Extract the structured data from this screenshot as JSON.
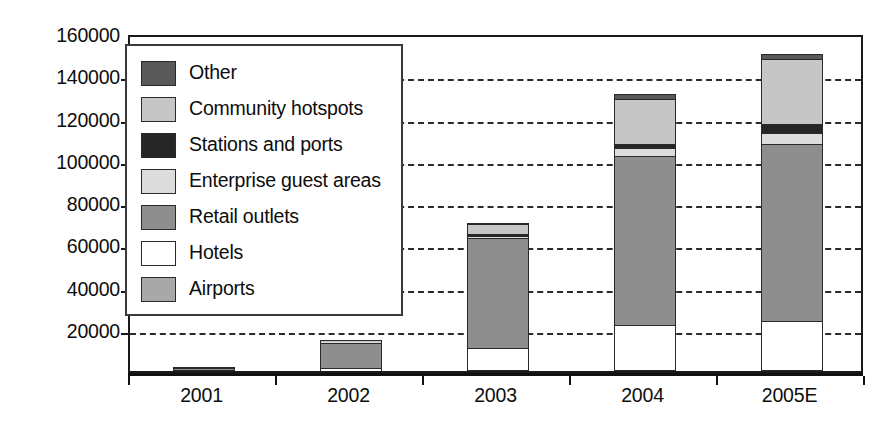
{
  "chart_data": {
    "type": "bar",
    "subtype": "stacked-vertical",
    "title": "",
    "xlabel": "",
    "ylabel": "",
    "categories": [
      "2001",
      "2002",
      "2003",
      "2004",
      "2005E"
    ],
    "ylim": [
      0,
      160000
    ],
    "ytick_step": 20000,
    "yticks": [
      0,
      20000,
      40000,
      60000,
      80000,
      100000,
      120000,
      140000,
      160000
    ],
    "ytick_labels": [
      "0",
      "20000",
      "40000",
      "60000",
      "80000",
      "100000",
      "120000",
      "140000",
      "160000"
    ],
    "grid": true,
    "grid_style": "dashed",
    "legend_position": "upper-left-inside",
    "stack_order_bottom_to_top": [
      "Airports",
      "Hotels",
      "Retail outlets",
      "Enterprise guest areas",
      "Stations and ports",
      "Community hotspots",
      "Other"
    ],
    "series": [
      {
        "name": "Airports",
        "color": "#a8a8a8",
        "values": [
          300,
          200,
          400,
          500,
          600
        ]
      },
      {
        "name": "Hotels",
        "color": "#ffffff",
        "values": [
          400,
          1200,
          10600,
          21500,
          23000
        ]
      },
      {
        "name": "Retail outlets",
        "color": "#8e8e8e",
        "values": [
          500,
          12000,
          52000,
          80000,
          84000
        ]
      },
      {
        "name": "Enterprise guest areas",
        "color": "#dcdcdc",
        "values": [
          100,
          300,
          800,
          3500,
          5000
        ]
      },
      {
        "name": "Stations and ports",
        "color": "#262626",
        "values": [
          100,
          200,
          1200,
          2000,
          4500
        ]
      },
      {
        "name": "Community hotspots",
        "color": "#c6c6c6",
        "values": [
          100,
          100,
          4500,
          21500,
          30500
        ]
      },
      {
        "name": "Other",
        "color": "#595959",
        "values": [
          0,
          0,
          500,
          2000,
          2400
        ]
      }
    ],
    "totals": [
      1500,
      14000,
      70000,
      131000,
      150000
    ]
  },
  "legend": {
    "items": [
      {
        "label": "Other",
        "color": "#595959"
      },
      {
        "label": "Community hotspots",
        "color": "#c6c6c6"
      },
      {
        "label": "Stations and ports",
        "color": "#262626"
      },
      {
        "label": "Enterprise guest areas",
        "color": "#dcdcdc"
      },
      {
        "label": "Retail outlets",
        "color": "#8e8e8e"
      },
      {
        "label": "Hotels",
        "color": "#ffffff"
      },
      {
        "label": "Airports",
        "color": "#a8a8a8"
      }
    ]
  },
  "axis": {
    "y_labels": [
      "160000",
      "140000",
      "120000",
      "100000",
      "80000",
      "60000",
      "40000",
      "20000"
    ],
    "x_labels": [
      "2001",
      "2002",
      "2003",
      "2004",
      "2005E"
    ]
  },
  "style": {
    "axis_color": "#111111",
    "grid_color": "#2b2b2b",
    "background": "#ffffff"
  }
}
